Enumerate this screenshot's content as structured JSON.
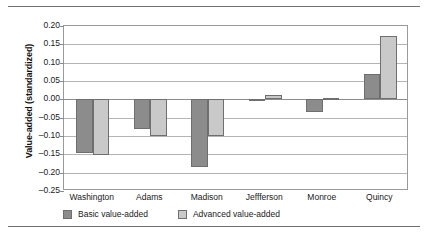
{
  "chart_data": {
    "type": "bar",
    "title": "",
    "xlabel": "",
    "ylabel": "Value-added (standardized)",
    "ylim": [
      -0.25,
      0.2
    ],
    "ytick_step": 0.05,
    "yticks": [
      "0.20",
      "0.15",
      "0.10",
      "0.05",
      "0.00",
      "-0.05",
      "-0.10",
      "-0.15",
      "-0.20",
      "-0.25"
    ],
    "ytick_values": [
      0.2,
      0.15,
      0.1,
      0.05,
      0.0,
      -0.05,
      -0.1,
      -0.15,
      -0.2,
      -0.25
    ],
    "grid": true,
    "legend_position": "below",
    "categories": [
      "Washington",
      "Adams",
      "Madison",
      "Jeffferson",
      "Monroe",
      "Quincy"
    ],
    "series": [
      {
        "name": "Basic value-added",
        "color": "#8c8c8c",
        "values": [
          -0.147,
          -0.08,
          -0.185,
          -0.005,
          -0.035,
          0.068
        ]
      },
      {
        "name": "Advanced value-added",
        "color": "#c9c9c9",
        "values": [
          -0.152,
          -0.101,
          -0.101,
          0.012,
          0.003,
          0.172
        ]
      }
    ]
  },
  "legend": {
    "items": [
      {
        "label": "Basic value-added"
      },
      {
        "label": "Advanced value-added"
      }
    ]
  },
  "axis": {
    "y_title": "Value-added (standardized)"
  }
}
